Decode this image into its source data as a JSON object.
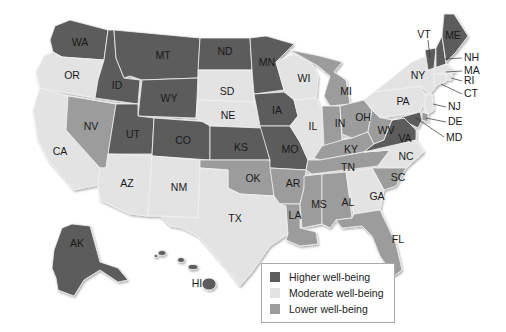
{
  "map": {
    "title": "U.S. state well-being",
    "categories": {
      "higher": {
        "label": "Higher well-being",
        "color": "#5c5c5c"
      },
      "moderate": {
        "label": "Moderate well-being",
        "color": "#e3e3e3"
      },
      "lower": {
        "label": "Lower well-being",
        "color": "#9c9c9c"
      }
    },
    "states": [
      {
        "abbr": "WA",
        "category": "higher"
      },
      {
        "abbr": "OR",
        "category": "moderate"
      },
      {
        "abbr": "CA",
        "category": "moderate"
      },
      {
        "abbr": "NV",
        "category": "lower"
      },
      {
        "abbr": "ID",
        "category": "higher"
      },
      {
        "abbr": "MT",
        "category": "higher"
      },
      {
        "abbr": "WY",
        "category": "higher"
      },
      {
        "abbr": "UT",
        "category": "higher"
      },
      {
        "abbr": "CO",
        "category": "higher"
      },
      {
        "abbr": "AZ",
        "category": "moderate"
      },
      {
        "abbr": "NM",
        "category": "moderate"
      },
      {
        "abbr": "ND",
        "category": "higher"
      },
      {
        "abbr": "SD",
        "category": "moderate"
      },
      {
        "abbr": "NE",
        "category": "moderate"
      },
      {
        "abbr": "KS",
        "category": "higher"
      },
      {
        "abbr": "OK",
        "category": "lower"
      },
      {
        "abbr": "TX",
        "category": "moderate"
      },
      {
        "abbr": "MN",
        "category": "higher"
      },
      {
        "abbr": "IA",
        "category": "higher"
      },
      {
        "abbr": "MO",
        "category": "higher"
      },
      {
        "abbr": "AR",
        "category": "lower"
      },
      {
        "abbr": "LA",
        "category": "lower"
      },
      {
        "abbr": "WI",
        "category": "moderate"
      },
      {
        "abbr": "IL",
        "category": "moderate"
      },
      {
        "abbr": "MI",
        "category": "lower"
      },
      {
        "abbr": "IN",
        "category": "lower"
      },
      {
        "abbr": "OH",
        "category": "lower"
      },
      {
        "abbr": "KY",
        "category": "lower"
      },
      {
        "abbr": "TN",
        "category": "lower"
      },
      {
        "abbr": "MS",
        "category": "lower"
      },
      {
        "abbr": "AL",
        "category": "lower"
      },
      {
        "abbr": "WV",
        "category": "lower"
      },
      {
        "abbr": "VA",
        "category": "higher"
      },
      {
        "abbr": "NC",
        "category": "moderate"
      },
      {
        "abbr": "SC",
        "category": "lower"
      },
      {
        "abbr": "GA",
        "category": "moderate"
      },
      {
        "abbr": "FL",
        "category": "lower"
      },
      {
        "abbr": "PA",
        "category": "moderate"
      },
      {
        "abbr": "NY",
        "category": "moderate"
      },
      {
        "abbr": "VT",
        "category": "higher"
      },
      {
        "abbr": "NH",
        "category": "higher"
      },
      {
        "abbr": "ME",
        "category": "higher"
      },
      {
        "abbr": "MA",
        "category": "moderate"
      },
      {
        "abbr": "RI",
        "category": "moderate"
      },
      {
        "abbr": "CT",
        "category": "moderate"
      },
      {
        "abbr": "NJ",
        "category": "moderate"
      },
      {
        "abbr": "DE",
        "category": "lower"
      },
      {
        "abbr": "MD",
        "category": "higher"
      },
      {
        "abbr": "AK",
        "category": "higher"
      },
      {
        "abbr": "HI",
        "category": "higher"
      }
    ],
    "labels": {
      "WA": "WA",
      "OR": "OR",
      "CA": "CA",
      "NV": "NV",
      "ID": "ID",
      "MT": "MT",
      "WY": "WY",
      "UT": "UT",
      "CO": "CO",
      "AZ": "AZ",
      "NM": "NM",
      "ND": "ND",
      "SD": "SD",
      "NE": "NE",
      "KS": "KS",
      "OK": "OK",
      "TX": "TX",
      "MN": "MN",
      "IA": "IA",
      "MO": "MO",
      "AR": "AR",
      "LA": "LA",
      "WI": "WI",
      "IL": "IL",
      "MI": "MI",
      "IN": "IN",
      "OH": "OH",
      "KY": "KY",
      "TN": "TN",
      "MS": "MS",
      "AL": "AL",
      "WV": "WV",
      "VA": "VA",
      "NC": "NC",
      "SC": "SC",
      "GA": "GA",
      "FL": "FL",
      "PA": "PA",
      "NY": "NY",
      "VT": "VT",
      "NH": "NH",
      "ME": "ME",
      "MA": "MA",
      "RI": "RI",
      "CT": "CT",
      "NJ": "NJ",
      "DE": "DE",
      "MD": "MD",
      "AK": "AK",
      "HI": "HI"
    }
  },
  "legend": {
    "items": [
      {
        "label": "Higher well-being",
        "color": "#5c5c5c"
      },
      {
        "label": "Moderate well-being",
        "color": "#e3e3e3"
      },
      {
        "label": "Lower well-being",
        "color": "#9c9c9c"
      }
    ]
  }
}
